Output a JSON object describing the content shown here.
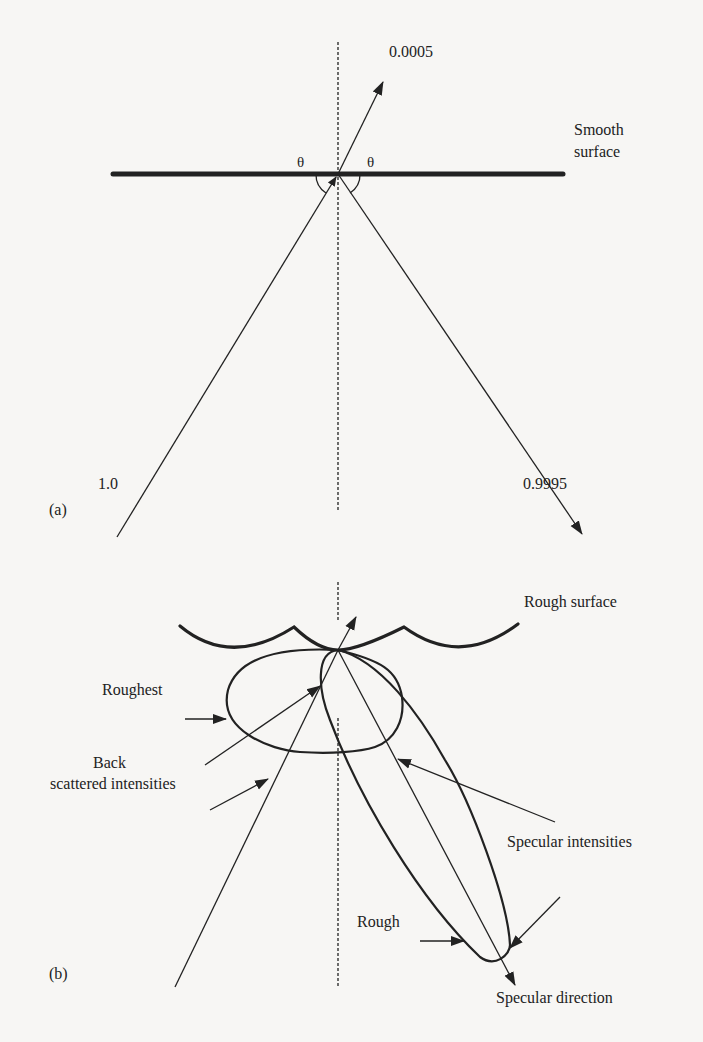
{
  "figure": {
    "panel_a": {
      "tag": "(a)",
      "surface_label_line1": "Smooth",
      "surface_label_line2": "surface",
      "incident_intensity": "1.0",
      "reflected_intensity": "0.9995",
      "transmitted_intensity": "0.0005",
      "angle_left": "θ",
      "angle_right": "θ"
    },
    "panel_b": {
      "tag": "(b)",
      "surface_label": "Rough surface",
      "roughest_label": "Roughest",
      "back_scattered_line1": "Back",
      "back_scattered_line2": "scattered intensities",
      "specular_intensities_label": "Specular intensities",
      "rough_label": "Rough",
      "specular_direction_label": "Specular direction"
    },
    "colors": {
      "ink": "#222222",
      "paper": "#f7f6f4"
    }
  }
}
